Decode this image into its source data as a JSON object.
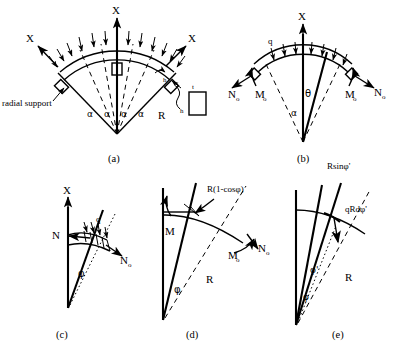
{
  "figure": {
    "panels": [
      {
        "id": "a",
        "caption": "(a)",
        "labels": {
          "axis_x_top": "X",
          "axis_x_left": "X",
          "axis_x_right": "X",
          "radial_support": "radial support",
          "alpha_1": "α",
          "alpha_2": "α",
          "alpha_3": "α",
          "alpha_4": "α",
          "radius": "R",
          "thickness_t": "t",
          "height_h": "h",
          "height_h2": "h"
        }
      },
      {
        "id": "b",
        "caption": "(b)",
        "labels": {
          "axis_x": "X",
          "load_q": "q",
          "normal_force_left": "N",
          "normal_force_left_sub": "o",
          "normal_force_right": "N",
          "normal_force_right_sub": "o",
          "moment_left": "M",
          "moment_left_sub": "o",
          "moment_right": "M",
          "moment_right_sub": "o",
          "theta": "θ",
          "alpha": "α"
        }
      },
      {
        "id": "c",
        "caption": "(c)",
        "labels": {
          "axis_x": "X",
          "normal_force_n": "N",
          "load_q": "q",
          "normal_force_n0": "N",
          "normal_force_n0_sub": "o",
          "phi": "φ"
        }
      },
      {
        "id": "d",
        "caption": "(d)",
        "labels": {
          "moment_m": "M",
          "arm_expression": "R(1-cosφ)",
          "moment_m0": "M",
          "moment_m0_sub": "o",
          "normal_force_n0": "N",
          "normal_force_n0_sub": "o",
          "radius": "R",
          "phi": "φ"
        }
      },
      {
        "id": "e",
        "caption": "(e)",
        "labels": {
          "arm_rsinphi": "Rsinφ'",
          "load_increment": "qRdφ'",
          "radius": "R",
          "phi_prime": "φ'",
          "phi": "φ"
        }
      }
    ],
    "colors": {
      "stroke": "#000000",
      "background": "#ffffff"
    }
  }
}
